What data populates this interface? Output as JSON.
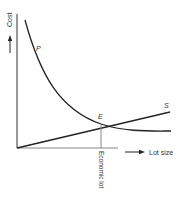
{
  "diagram": {
    "type": "economic-lot-size",
    "y_axis_label": "Cost",
    "x_axis_label": "Lot size",
    "curves": [
      {
        "id": "P",
        "label": "P",
        "description": "decreasing cost curve"
      },
      {
        "id": "S",
        "label": "S",
        "description": "increasing linear cost line"
      }
    ],
    "intersection": {
      "label": "E"
    },
    "vertical_marker_label": "Economic lot",
    "colors": {
      "axis": "#555555",
      "curve": "#222222",
      "text": "#333333"
    }
  }
}
